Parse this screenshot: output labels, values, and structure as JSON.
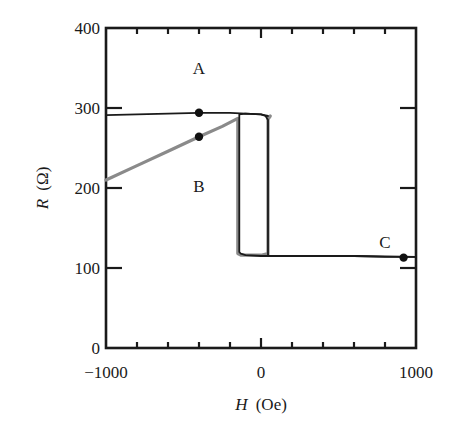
{
  "chart_data": {
    "type": "line",
    "title": "",
    "xlabel": "H (Oe)",
    "xlabel_var": "H",
    "xlabel_unit": "(Oe)",
    "ylabel": "R (Ω)",
    "ylabel_var": "R",
    "ylabel_unit": "(Ω)",
    "xlim": [
      -1000,
      1000
    ],
    "ylim": [
      0,
      400
    ],
    "x_ticks": [
      -1000,
      0,
      1000
    ],
    "x_tick_labels": [
      "−1000",
      "0",
      "1000"
    ],
    "x_minor_step": 200,
    "y_ticks": [
      0,
      100,
      200,
      300,
      400
    ],
    "y_tick_labels": [
      "0",
      "100",
      "200",
      "300",
      "400"
    ],
    "grid": false,
    "legend": null,
    "series": [
      {
        "name": "A (major loop, black)",
        "color": "#1a1a1a",
        "x": [
          -1000,
          -800,
          -600,
          -400,
          -200,
          -100,
          0,
          30,
          45,
          45,
          60,
          200,
          400,
          600,
          800,
          1000
        ],
        "y": [
          291,
          292,
          293,
          294,
          294,
          293,
          292,
          290,
          285,
          116,
          115,
          115,
          115,
          115,
          114,
          114
        ]
      },
      {
        "name": "A return branch (black)",
        "color": "#1a1a1a",
        "x": [
          1000,
          600,
          200,
          0,
          -100,
          -130,
          -140,
          -140,
          -100,
          0,
          45
        ],
        "y": [
          114,
          115,
          115,
          115,
          116,
          118,
          120,
          292,
          293,
          292,
          290
        ]
      },
      {
        "name": "B (minor loop, gray)",
        "color": "#8a8a8a",
        "x": [
          -1000,
          -800,
          -600,
          -400,
          -250,
          -150,
          -150,
          -130,
          0,
          45,
          45,
          60
        ],
        "y": [
          210,
          228,
          246,
          264,
          277,
          287,
          118,
          116,
          116,
          118,
          286,
          290
        ]
      }
    ],
    "points": [
      {
        "label": "A",
        "x": -400,
        "y": 294
      },
      {
        "label": "B",
        "x": -400,
        "y": 264
      },
      {
        "label": "C",
        "x": 920,
        "y": 113
      }
    ],
    "annotations": [
      {
        "text": "A",
        "x": -400,
        "y": 350
      },
      {
        "text": "B",
        "x": -400,
        "y": 203
      },
      {
        "text": "C",
        "x": 800,
        "y": 133
      }
    ]
  }
}
